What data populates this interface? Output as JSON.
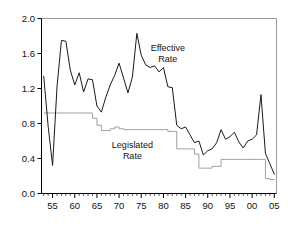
{
  "chart_data": {
    "type": "line",
    "title": "",
    "subtitle": "",
    "xlabel": "",
    "ylabel": "",
    "xlim": [
      1952.5,
      2005.5
    ],
    "ylim": [
      0.0,
      2.0
    ],
    "grid": false,
    "legend_position": "inline-annotations",
    "y_ticks": [
      "0.0",
      "0.4",
      "0.8",
      "1.2",
      "1.6",
      "2.0"
    ],
    "y_tick_values": [
      0.0,
      0.4,
      0.8,
      1.2,
      1.6,
      2.0
    ],
    "x_ticks": [
      "55",
      "60",
      "65",
      "70",
      "75",
      "80",
      "85",
      "90",
      "95",
      "00",
      "05"
    ],
    "x_tick_values": [
      1955,
      1960,
      1965,
      1970,
      1975,
      1980,
      1985,
      1990,
      1995,
      2000,
      2005
    ],
    "annotations": [
      {
        "name": "effective-rate-label",
        "text": "Effective",
        "text2": "Rate",
        "x": 1981,
        "y": 1.63
      },
      {
        "name": "legislated-rate-label",
        "text": "Legislated",
        "text2": "Rate",
        "x": 1973,
        "y": 0.52
      }
    ],
    "series": [
      {
        "name": "Effective Rate",
        "color": "#1a1a1a",
        "x": [
          1953,
          1954,
          1955,
          1956,
          1957,
          1958,
          1959,
          1960,
          1961,
          1962,
          1963,
          1964,
          1965,
          1966,
          1967,
          1968,
          1969,
          1970,
          1971,
          1972,
          1973,
          1974,
          1975,
          1976,
          1977,
          1978,
          1979,
          1980,
          1981,
          1982,
          1983,
          1984,
          1985,
          1986,
          1987,
          1988,
          1989,
          1990,
          1991,
          1992,
          1993,
          1994,
          1995,
          1996,
          1997,
          1998,
          1999,
          2000,
          2001,
          2002,
          2003,
          2004,
          2005
        ],
        "values": [
          1.34,
          0.77,
          0.32,
          1.22,
          1.75,
          1.74,
          1.41,
          1.24,
          1.38,
          1.16,
          1.31,
          1.3,
          1.0,
          0.93,
          1.1,
          1.24,
          1.35,
          1.49,
          1.32,
          1.15,
          1.33,
          1.83,
          1.58,
          1.47,
          1.44,
          1.46,
          1.39,
          1.44,
          1.22,
          1.21,
          0.78,
          0.74,
          0.76,
          0.67,
          0.58,
          0.6,
          0.44,
          0.49,
          0.51,
          0.58,
          0.73,
          0.62,
          0.65,
          0.7,
          0.59,
          0.52,
          0.6,
          0.62,
          0.67,
          1.13,
          0.46,
          0.34,
          0.22
        ]
      },
      {
        "name": "Legislated Rate",
        "color": "#a0a0a0",
        "x": [
          1953,
          1954,
          1955,
          1956,
          1957,
          1958,
          1959,
          1960,
          1961,
          1962,
          1963,
          1964,
          1965,
          1966,
          1967,
          1968,
          1969,
          1970,
          1971,
          1972,
          1973,
          1974,
          1975,
          1976,
          1977,
          1978,
          1979,
          1980,
          1981,
          1982,
          1983,
          1984,
          1985,
          1986,
          1987,
          1988,
          1989,
          1990,
          1991,
          1992,
          1993,
          1994,
          1995,
          1996,
          1997,
          1998,
          1999,
          2000,
          2001,
          2002,
          2003,
          2004,
          2005
        ],
        "values": [
          0.92,
          0.92,
          0.92,
          0.92,
          0.92,
          0.92,
          0.92,
          0.92,
          0.92,
          0.92,
          0.92,
          0.86,
          0.78,
          0.72,
          0.72,
          0.74,
          0.76,
          0.74,
          0.73,
          0.73,
          0.73,
          0.73,
          0.73,
          0.73,
          0.73,
          0.73,
          0.73,
          0.73,
          0.71,
          0.71,
          0.51,
          0.51,
          0.51,
          0.51,
          0.45,
          0.29,
          0.29,
          0.29,
          0.31,
          0.31,
          0.39,
          0.39,
          0.39,
          0.39,
          0.39,
          0.39,
          0.39,
          0.39,
          0.39,
          0.39,
          0.17,
          0.16,
          0.16
        ]
      }
    ]
  },
  "axes": {
    "left_axis_name": "y-axis",
    "bottom_axis_name": "x-axis"
  }
}
